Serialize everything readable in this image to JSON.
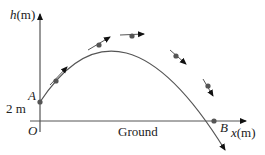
{
  "diagram": {
    "type": "projectile-trajectory",
    "y_axis_label_var": "h",
    "y_axis_label_unit": "(m)",
    "x_axis_label_var": "x",
    "x_axis_label_unit": "(m)",
    "origin_label": "O",
    "start_point_label": "A",
    "start_height_label": "2 m",
    "end_point_label": "B",
    "ground_label": "Ground",
    "colors": {
      "axis": "#333333",
      "curve": "#555555",
      "point": "#555555",
      "arrow": "#111111"
    }
  }
}
